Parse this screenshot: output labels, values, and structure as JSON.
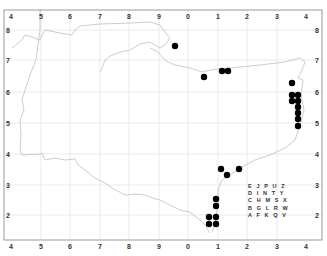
{
  "map": {
    "frame": {
      "left": 4,
      "top": 10,
      "right": 322,
      "bottom": 240
    },
    "colors": {
      "frame": "#999999",
      "grid": "#e4e4e4",
      "coast": "#bfbfbf",
      "dot": "#000000"
    },
    "x_ticks": [
      {
        "label": "4",
        "x": 11
      },
      {
        "label": "5",
        "x": 41
      },
      {
        "label": "6",
        "x": 70
      },
      {
        "label": "7",
        "x": 100
      },
      {
        "label": "8",
        "x": 129
      },
      {
        "label": "9",
        "x": 159
      },
      {
        "label": "0",
        "x": 188
      },
      {
        "label": "1",
        "x": 218
      },
      {
        "label": "2",
        "x": 247
      },
      {
        "label": "3",
        "x": 277
      },
      {
        "label": "4",
        "x": 306
      }
    ],
    "y_ticks": [
      {
        "label": "8",
        "y": 30
      },
      {
        "label": "7",
        "y": 60
      },
      {
        "label": "6",
        "y": 92
      },
      {
        "label": "5",
        "y": 123
      },
      {
        "label": "4",
        "y": 154
      },
      {
        "label": "3",
        "y": 185
      },
      {
        "label": "2",
        "y": 215
      }
    ],
    "corner_labels": {
      "top_left": "4",
      "bottom_left": "4",
      "top_right": "4",
      "bottom_right": "4"
    },
    "records": [
      {
        "x": 175,
        "y": 46
      },
      {
        "x": 204,
        "y": 77
      },
      {
        "x": 222,
        "y": 71
      },
      {
        "x": 228,
        "y": 71
      },
      {
        "x": 292,
        "y": 83
      },
      {
        "x": 292,
        "y": 95
      },
      {
        "x": 298,
        "y": 95
      },
      {
        "x": 292,
        "y": 101
      },
      {
        "x": 298,
        "y": 101
      },
      {
        "x": 298,
        "y": 107
      },
      {
        "x": 298,
        "y": 113
      },
      {
        "x": 298,
        "y": 119
      },
      {
        "x": 298,
        "y": 126
      },
      {
        "x": 221,
        "y": 169
      },
      {
        "x": 227,
        "y": 175
      },
      {
        "x": 239,
        "y": 169
      },
      {
        "x": 216,
        "y": 199
      },
      {
        "x": 216,
        "y": 206
      },
      {
        "x": 209,
        "y": 217
      },
      {
        "x": 216,
        "y": 217
      },
      {
        "x": 209,
        "y": 224
      },
      {
        "x": 216,
        "y": 224
      }
    ],
    "legend": {
      "rows": [
        "E J P U Z",
        "D I N T Y",
        "C H M S X",
        "B G L R W",
        "A F K Q V"
      ]
    }
  }
}
